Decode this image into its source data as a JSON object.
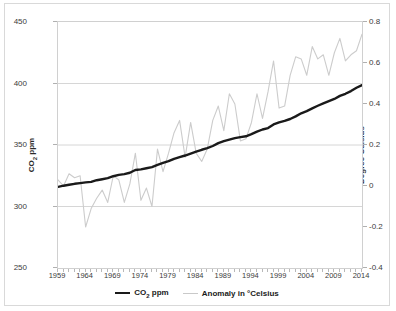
{
  "chart_data": {
    "type": "line",
    "title": "",
    "subtitle": "",
    "xlabel": "",
    "ylabel": "CO2 ppm",
    "y2label": "Degree Celsius",
    "grid": true,
    "legend_position": "bottom",
    "xlim": [
      1959,
      2014
    ],
    "ylim": [
      250,
      450
    ],
    "y2lim": [
      -0.4,
      0.8
    ],
    "xticks": [
      "1959",
      "1964",
      "1969",
      "1974",
      "1979",
      "1984",
      "1989",
      "1994",
      "1999",
      "2004",
      "2009",
      "2014"
    ],
    "yticks": [
      "250",
      "300",
      "350",
      "400",
      "450"
    ],
    "y2ticks": [
      "-0.4",
      "-0.2",
      "0",
      "0.2",
      "0.4",
      "0.6",
      "0.8"
    ],
    "x": [
      1959,
      1960,
      1961,
      1962,
      1963,
      1964,
      1965,
      1966,
      1967,
      1968,
      1969,
      1970,
      1971,
      1972,
      1973,
      1974,
      1975,
      1976,
      1977,
      1978,
      1979,
      1980,
      1981,
      1982,
      1983,
      1984,
      1985,
      1986,
      1987,
      1988,
      1989,
      1990,
      1991,
      1992,
      1993,
      1994,
      1995,
      1996,
      1997,
      1998,
      1999,
      2000,
      2001,
      2002,
      2003,
      2004,
      2005,
      2006,
      2007,
      2008,
      2009,
      2010,
      2011,
      2012,
      2013,
      2014
    ],
    "series": [
      {
        "name": "CO2 ppm",
        "axis": "left",
        "color": "#1a1a1a",
        "width": 2.6,
        "values": [
          315.97,
          316.91,
          317.64,
          318.45,
          318.99,
          319.62,
          320.04,
          321.38,
          322.16,
          323.04,
          324.62,
          325.68,
          326.32,
          327.45,
          329.68,
          330.18,
          331.11,
          332.04,
          333.83,
          335.4,
          336.84,
          338.75,
          340.11,
          341.45,
          343.05,
          344.65,
          346.12,
          347.42,
          349.19,
          351.57,
          353.12,
          354.39,
          355.61,
          356.45,
          357.1,
          358.83,
          360.82,
          362.61,
          363.73,
          366.7,
          368.38,
          369.55,
          371.14,
          373.28,
          375.8,
          377.52,
          379.8,
          381.9,
          383.79,
          385.6,
          387.43,
          389.9,
          391.65,
          393.85,
          396.52,
          398.65
        ]
      },
      {
        "name": "Anomaly in °Celsius",
        "axis": "right",
        "color": "#cccccc",
        "width": 1.2,
        "values": [
          0.03,
          0.0,
          0.06,
          0.04,
          0.05,
          -0.2,
          -0.11,
          -0.06,
          -0.02,
          -0.08,
          0.05,
          0.03,
          -0.08,
          0.01,
          0.16,
          -0.07,
          -0.01,
          -0.1,
          0.18,
          0.07,
          0.16,
          0.26,
          0.32,
          0.14,
          0.31,
          0.16,
          0.12,
          0.18,
          0.32,
          0.39,
          0.27,
          0.45,
          0.4,
          0.22,
          0.23,
          0.31,
          0.45,
          0.33,
          0.46,
          0.61,
          0.38,
          0.39,
          0.54,
          0.63,
          0.62,
          0.54,
          0.68,
          0.62,
          0.64,
          0.54,
          0.65,
          0.72,
          0.61,
          0.64,
          0.66,
          0.74
        ]
      }
    ]
  },
  "axes": {
    "left_title": "CO",
    "left_title_sub": "2",
    "left_title_rest": " ppm",
    "right_title": "Degree Celsius"
  },
  "legend": {
    "items": [
      {
        "label_main": "CO",
        "label_sub": "2",
        "label_rest": " ppm",
        "color": "#1a1a1a",
        "thickness": "2.5px"
      },
      {
        "label_main": "Anomaly in °Celsius",
        "label_sub": "",
        "label_rest": "",
        "color": "#c9c9c9",
        "thickness": "1.5px"
      }
    ]
  },
  "colors": {
    "co2_line": "#1a1a1a",
    "anomaly_line": "#cccccc",
    "grid": "#d6d6d6",
    "frame_border": "#d9d9d9",
    "plot_border": "#d0d0d0",
    "text": "#3b3b3b",
    "background": "#ffffff"
  }
}
